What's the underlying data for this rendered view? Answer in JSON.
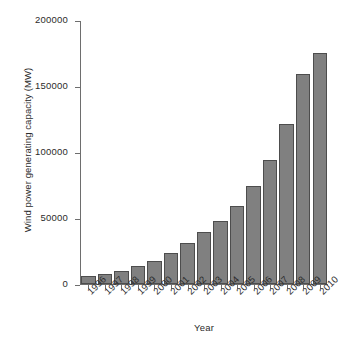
{
  "chart_data": {
    "type": "bar",
    "title": "",
    "xlabel": "Year",
    "ylabel": "Wind power generating capacity (MW)",
    "categories": [
      "1996",
      "1997",
      "1998",
      "1999",
      "2000",
      "2001",
      "2002",
      "2003",
      "2004",
      "2005",
      "2006",
      "2007",
      "2008",
      "2009",
      "2010"
    ],
    "values": [
      6100,
      7600,
      10200,
      13600,
      17400,
      23900,
      31100,
      39400,
      47600,
      59000,
      74000,
      94000,
      121000,
      159000,
      175000
    ],
    "ylim": [
      0,
      200000
    ],
    "yticks": [
      0,
      50000,
      100000,
      150000,
      200000
    ],
    "ytick_labels": [
      "0",
      "50000",
      "100000",
      "150000",
      "200000"
    ],
    "grid": false,
    "legend": false,
    "legend_position": "none",
    "bar_color": "#808080",
    "bar_edge_color": "#4d4d4d",
    "axis_color": "#6e6e6e",
    "background_color": "#ffffff",
    "xtick_rotation": -45
  }
}
